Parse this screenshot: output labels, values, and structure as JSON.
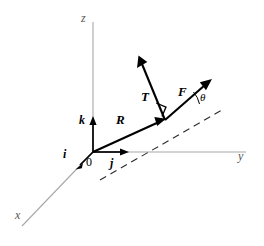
{
  "figure": {
    "background_color": "#ffffff",
    "axis_color": "#a8a8a8",
    "vector_color": "#000000",
    "dash_color": "#2b2b2b"
  },
  "axes": [
    {
      "name": "z-axis",
      "label": "z",
      "direction": "up"
    },
    {
      "name": "y-axis",
      "label": "y",
      "direction": "right"
    },
    {
      "name": "x-axis",
      "label": "x",
      "direction": "down-left"
    }
  ],
  "origin": {
    "label": "0"
  },
  "unit_vectors": [
    {
      "name": "i",
      "label": "i",
      "axis": "x"
    },
    {
      "name": "j",
      "label": "j",
      "axis": "y"
    },
    {
      "name": "k",
      "label": "k",
      "axis": "z"
    }
  ],
  "vectors": [
    {
      "name": "R",
      "label": "R",
      "description": "position vector from origin"
    },
    {
      "name": "T",
      "label": "T",
      "description": "tension vector, perpendicular to dashed line"
    },
    {
      "name": "F",
      "label": "F",
      "description": "force vector at angle theta to dashed line"
    }
  ],
  "angle": {
    "name": "theta",
    "label": "θ"
  },
  "markers": [
    {
      "name": "right-angle-marker",
      "label": ""
    }
  ]
}
